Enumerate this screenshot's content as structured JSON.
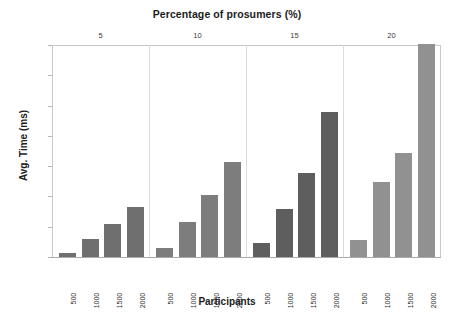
{
  "chart_data": {
    "type": "bar",
    "title": "Percentage of prosumers (%)",
    "xlabel": "Participants",
    "ylabel": "Avg. Time (ms)",
    "ylim": [
      0,
      700
    ],
    "yticks": [
      0,
      100,
      200,
      300,
      400,
      500,
      600,
      700
    ],
    "ytick_labels": [
      "0",
      "100",
      "200",
      "300",
      "400",
      "500",
      "600",
      "700"
    ],
    "grid": false,
    "legend": "none",
    "group_axis_position": "top",
    "group_labels": [
      "5",
      "10",
      "15",
      "20"
    ],
    "categories": [
      "500",
      "1000",
      "1500",
      "2000"
    ],
    "groups": [
      {
        "label": "5",
        "categories": [
          "500",
          "1000",
          "1500",
          "2000"
        ],
        "values": [
          12,
          60,
          110,
          165
        ],
        "color": "#6f6f6f"
      },
      {
        "label": "10",
        "categories": [
          "500",
          "1000",
          "1500",
          "2000"
        ],
        "values": [
          30,
          115,
          205,
          313
        ],
        "color": "#7d7d7d"
      },
      {
        "label": "15",
        "categories": [
          "500",
          "1000",
          "1500",
          "2000"
        ],
        "values": [
          45,
          160,
          278,
          478
        ],
        "color": "#5e5e5e"
      },
      {
        "label": "20",
        "categories": [
          "500",
          "1000",
          "1500",
          "2000"
        ],
        "values": [
          57,
          248,
          345,
          702
        ],
        "color": "#919191"
      }
    ],
    "series": [
      {
        "name": "500",
        "values": [
          12,
          30,
          45,
          57
        ]
      },
      {
        "name": "1000",
        "values": [
          60,
          115,
          160,
          248
        ]
      },
      {
        "name": "1500",
        "values": [
          110,
          205,
          278,
          345
        ]
      },
      {
        "name": "2000",
        "values": [
          165,
          313,
          478,
          702
        ]
      }
    ]
  },
  "colors": {
    "background": "#ffffff",
    "axis": "#c9c9c9",
    "baseline": "#aaaaaa",
    "separator": "#dcdcdc",
    "text": "#1c1c1c"
  }
}
